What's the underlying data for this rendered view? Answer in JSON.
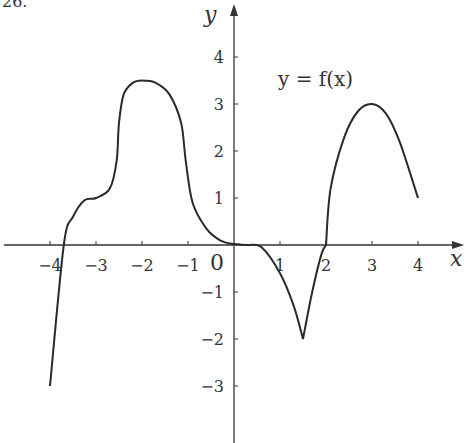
{
  "problem_number": "26.",
  "chart_data": {
    "type": "line",
    "title": "",
    "xlabel": "x",
    "ylabel": "y",
    "origin_label": "0",
    "curve_label": "y = f(x)",
    "xlim": [
      -4.8,
      4.8
    ],
    "ylim": [
      -4,
      5
    ],
    "grid": false,
    "legend": "none",
    "x_ticks": [
      -4,
      -3,
      -2,
      -1,
      1,
      2,
      3,
      4
    ],
    "x_tick_labels": [
      "−4",
      "−3",
      "−2",
      "−1",
      "1",
      "2",
      "3",
      "4"
    ],
    "y_ticks": [
      4,
      3,
      2,
      1,
      -1,
      -2,
      -3
    ],
    "y_tick_labels": [
      "4",
      "3",
      "2",
      "1",
      "−1",
      "−2",
      "−3"
    ],
    "series": [
      {
        "name": "f(x)",
        "x": [
          -4,
          -3.7,
          -3.5,
          -3.25,
          -3,
          -2.7,
          -2.55,
          -2.5,
          -2.4,
          -2.2,
          -2,
          -1.7,
          -1.4,
          -1.15,
          -1.05,
          -0.9,
          -0.6,
          -0.3,
          0,
          0.3,
          0.6,
          1.0,
          1.3,
          1.5,
          1.7,
          1.9,
          2.0,
          2.1,
          2.4,
          2.7,
          3.0,
          3.3,
          3.6,
          4.0
        ],
        "y": [
          -3,
          0,
          0.6,
          0.95,
          1.0,
          1.2,
          1.8,
          2.6,
          3.2,
          3.45,
          3.5,
          3.45,
          3.2,
          2.6,
          1.8,
          0.9,
          0.35,
          0.1,
          0.02,
          0,
          -0.05,
          -0.6,
          -1.3,
          -2.0,
          -1.0,
          -0.2,
          0,
          1.2,
          2.3,
          2.85,
          3.0,
          2.8,
          2.2,
          1.0
        ]
      }
    ],
    "key_points": [
      {
        "x": -3,
        "y": 1
      },
      {
        "x": -2,
        "y": 3.5
      },
      {
        "x": 0,
        "y": 0
      },
      {
        "x": 1.5,
        "y": -2
      },
      {
        "x": 2,
        "y": 0
      },
      {
        "x": 3,
        "y": 3
      },
      {
        "x": 4,
        "y": 1
      }
    ]
  }
}
